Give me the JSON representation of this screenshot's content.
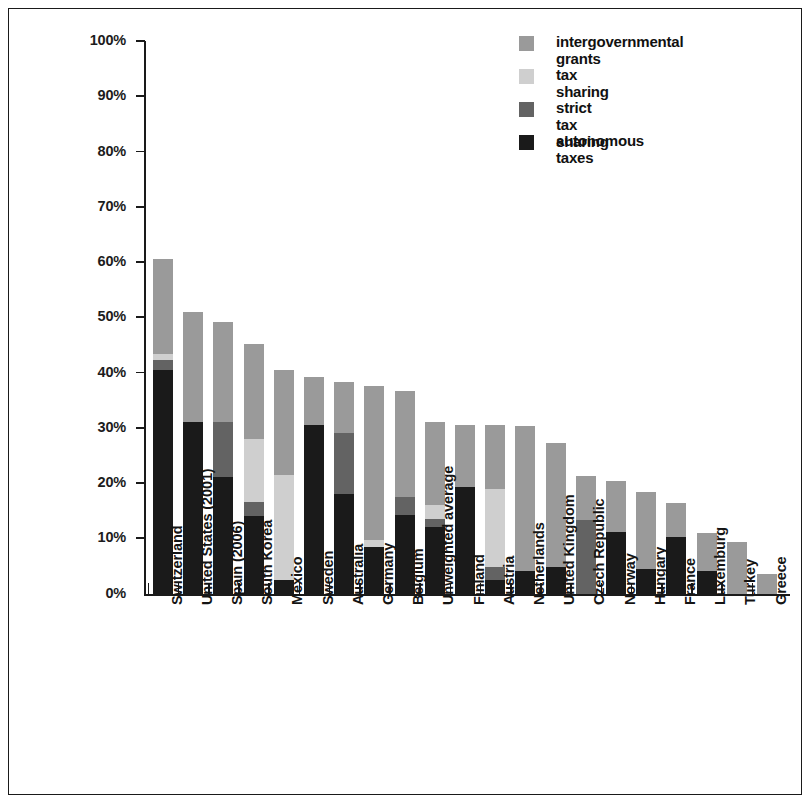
{
  "chart_data": {
    "type": "bar",
    "subtype": "stacked-bar",
    "title": "",
    "xlabel": "",
    "ylabel": "",
    "ylim": [
      0,
      100
    ],
    "y_unit": "%",
    "y_ticks": [
      "0%",
      "10%",
      "20%",
      "30%",
      "40%",
      "50%",
      "60%",
      "70%",
      "80%",
      "90%",
      "100%"
    ],
    "grid": false,
    "legend_position": "top-right",
    "legend": [
      {
        "label": "intergovernmental grants",
        "color": "#9a9a9a",
        "key": "grants"
      },
      {
        "label": "tax sharing",
        "color": "#cfcfcf",
        "key": "tax_sharing"
      },
      {
        "label": "strict tax sharing",
        "color": "#636363",
        "key": "strict_tax_sharing"
      },
      {
        "label": "autonomous taxes",
        "color": "#1a1a1a",
        "key": "autonomous_taxes"
      }
    ],
    "categories": [
      "Switzerland",
      "United States (2001)",
      "Spain (2006)",
      "South Korea",
      "Mexico",
      "Sweden",
      "Australia",
      "Germany",
      "Belgium",
      "Unweighted average",
      "Finland",
      "Austria",
      "Netherlands",
      "United Kingdom",
      "Czech Republic",
      "Norway",
      "Hungary",
      "France",
      "Luxemburg",
      "Turkey",
      "Greece"
    ],
    "series": [
      {
        "name": "autonomous taxes",
        "color": "#1a1a1a",
        "values": [
          40.5,
          31.0,
          21.0,
          14.0,
          2.5,
          30.5,
          18.0,
          8.5,
          14.3,
          12.0,
          19.3,
          2.5,
          4.0,
          4.8,
          0.0,
          11.2,
          4.5,
          10.3,
          4.0,
          0.0,
          0.0
        ]
      },
      {
        "name": "strict tax sharing",
        "color": "#636363",
        "values": [
          1.7,
          0.0,
          10.0,
          2.5,
          0.0,
          0.0,
          11.0,
          0.0,
          3.2,
          1.4,
          0.0,
          2.3,
          0.0,
          0.0,
          13.3,
          0.0,
          0.0,
          0.0,
          0.0,
          0.0,
          0.0
        ]
      },
      {
        "name": "tax sharing",
        "color": "#cfcfcf",
        "values": [
          1.1,
          0.0,
          0.0,
          11.5,
          19.0,
          0.0,
          0.0,
          1.2,
          0.0,
          2.6,
          0.0,
          14.2,
          0.0,
          0.0,
          0.0,
          0.0,
          0.0,
          0.0,
          0.0,
          0.0,
          0.0
        ]
      },
      {
        "name": "intergovernmental grants",
        "color": "#9a9a9a",
        "values": [
          17.2,
          20.0,
          18.2,
          17.2,
          19.0,
          8.7,
          9.2,
          27.8,
          19.2,
          15.0,
          11.2,
          11.5,
          26.3,
          22.4,
          8.0,
          9.1,
          13.8,
          6.0,
          7.0,
          9.3,
          3.5
        ]
      }
    ],
    "totals": [
      60.5,
      51.0,
      49.2,
      45.2,
      40.5,
      39.2,
      38.2,
      37.5,
      36.7,
      31.0,
      30.5,
      30.5,
      30.3,
      27.2,
      21.3,
      20.3,
      18.3,
      16.3,
      11.0,
      9.3,
      3.5
    ]
  }
}
